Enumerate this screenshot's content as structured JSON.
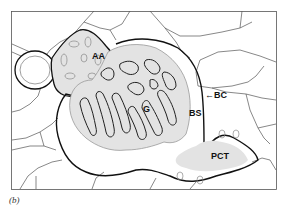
{
  "figure": {
    "panel_label": "(b)",
    "labels": {
      "afferent_arteriole": "AA",
      "glomerulus": "G",
      "bowmans_space": "BS",
      "bowmans_capsule": "BC",
      "proximal_convoluted_tubule": "PCT"
    },
    "colors": {
      "tissue_fill": "#e3e3e3",
      "outline": "#111111",
      "cell_border": "#444444",
      "background": "#ffffff"
    }
  }
}
